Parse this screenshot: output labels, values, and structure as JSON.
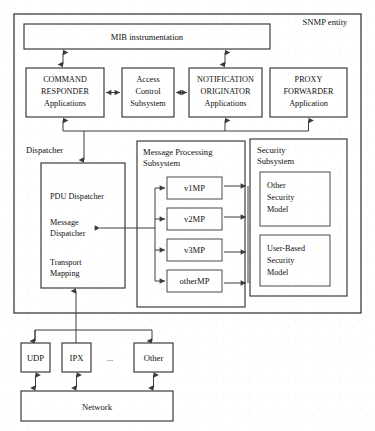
{
  "diagram": {
    "entity_label": "SNMP entity",
    "colors": {
      "background": "#ffffff",
      "line": "#3c3c3c",
      "text": "#111111"
    },
    "mib": {
      "label": "MIB instrumentation"
    },
    "applications": [
      {
        "id": "command-responder",
        "line1": "COMMAND",
        "line2": "RESPONDER",
        "line3": "Applications"
      },
      {
        "id": "access-control-subsystem",
        "line1": "Access",
        "line2": "Control",
        "line3": "Subsystem"
      },
      {
        "id": "notification-originator",
        "line1": "NOTIFICATION",
        "line2": "ORIGINATOR",
        "line3": "Applications"
      },
      {
        "id": "proxy-forwarder",
        "line1": "PROXY",
        "line2": "FORWARDER",
        "line3": "Application"
      }
    ],
    "dispatcher": {
      "label": "Dispatcher",
      "items": [
        {
          "id": "pdu-dispatcher",
          "line1": "PDU Dispatcher",
          "line2": ""
        },
        {
          "id": "message-dispatcher",
          "line1": "Message",
          "line2": "Dispatcher"
        },
        {
          "id": "transport-mapping",
          "line1": "Transport",
          "line2": "Mapping"
        }
      ]
    },
    "message_processing": {
      "label_line1": "Message Processing",
      "label_line2": "Subsystem",
      "models": [
        {
          "id": "v1mp",
          "label": "v1MP"
        },
        {
          "id": "v2mp",
          "label": "v2MP"
        },
        {
          "id": "v3mp",
          "label": "v3MP"
        },
        {
          "id": "othermp",
          "label": "otherMP"
        }
      ]
    },
    "security": {
      "label_line1": "Security",
      "label_line2": "Subsystem",
      "models": [
        {
          "id": "other-security-model",
          "line1": "Other",
          "line2": "Security",
          "line3": "Model"
        },
        {
          "id": "user-based-security-model",
          "line1": "User-Based",
          "line2": "Security",
          "line3": "Model"
        }
      ]
    },
    "transports": [
      {
        "id": "udp",
        "label": "UDP"
      },
      {
        "id": "ipx",
        "label": "IPX"
      },
      {
        "id": "ellipsis",
        "label": "..."
      },
      {
        "id": "other-transport",
        "label": "Other"
      }
    ],
    "network": {
      "label": "Network"
    }
  }
}
